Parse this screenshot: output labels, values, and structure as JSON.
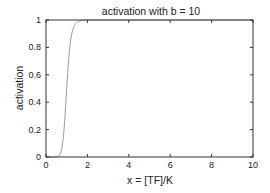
{
  "chart_data": {
    "type": "line",
    "title": "activation with b = 10",
    "xlabel": "x = [TF]/K",
    "ylabel": "activation",
    "xlim": [
      0,
      10
    ],
    "ylim": [
      0,
      1
    ],
    "xticks": [
      0,
      2,
      4,
      6,
      8,
      10
    ],
    "xtick_labels": [
      "0",
      "2",
      "4",
      "6",
      "8",
      "10"
    ],
    "yticks": [
      0,
      0.2,
      0.4,
      0.6,
      0.8,
      1
    ],
    "ytick_labels": [
      "0",
      "0.2",
      "0.4",
      "0.6",
      "0.8",
      "1"
    ],
    "grid": false,
    "legend": null,
    "series": [
      {
        "name": "activation",
        "function": "x^10 / (1 + x^10)",
        "color": "#999999",
        "x": [
          0,
          0.5,
          0.6,
          0.7,
          0.8,
          0.9,
          1.0,
          1.1,
          1.2,
          1.3,
          1.4,
          1.5,
          1.6,
          1.8,
          2.0,
          3,
          4,
          5,
          6,
          7,
          8,
          9,
          10
        ],
        "values": [
          0,
          0.001,
          0.006,
          0.027,
          0.097,
          0.259,
          0.5,
          0.722,
          0.861,
          0.932,
          0.967,
          0.983,
          0.991,
          0.997,
          0.999,
          1,
          1,
          1,
          1,
          1,
          1,
          1,
          1
        ]
      }
    ]
  },
  "colors": {
    "axis": "#333333",
    "curve": "#999999",
    "background": "#ffffff"
  }
}
